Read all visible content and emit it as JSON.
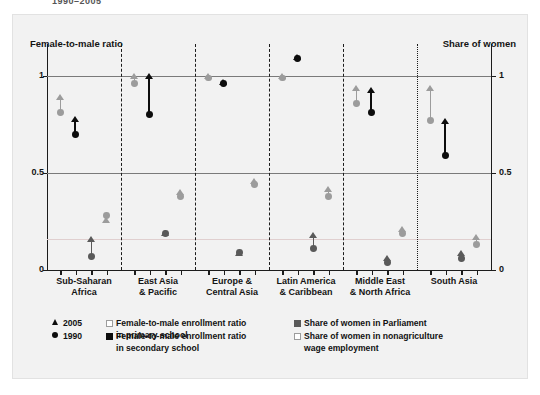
{
  "header": {
    "clipped_top_text": "1990–2005"
  },
  "axis": {
    "left_title": "Female-to-male ratio",
    "right_title": "Share of women",
    "ticks": [
      "1",
      "0.5",
      "0"
    ],
    "tick_values": [
      1,
      0.5,
      0
    ],
    "ymin": 0,
    "ymax": 1.18
  },
  "legend": {
    "year_markers": [
      {
        "symbol": "triangle",
        "label": "2005"
      },
      {
        "symbol": "circle",
        "label": "1990"
      }
    ],
    "series": [
      {
        "label": "Female-to-male enrollment ratio\nin primary school",
        "color": "#9c9c9c",
        "swatch": "open-square"
      },
      {
        "label": "Female-to-male enrollment ratio\nin secondary school",
        "color": "#0d0d0d",
        "swatch": "filled-square"
      },
      {
        "label": "Share of women in Parliament",
        "color": "#5a5a5a",
        "swatch": "filled-square"
      },
      {
        "label": "Share of women in nonagriculture\nwage employment",
        "color": "#9c9c9c",
        "swatch": "open-square"
      }
    ]
  },
  "chart_data": {
    "type": "scatter",
    "title": "",
    "subtitle": "",
    "xlabel": "",
    "ylabel_left": "Female-to-male ratio",
    "ylabel_right": "Share of women",
    "ylim": [
      0,
      1.18
    ],
    "grid": true,
    "gridlines": [
      1,
      0.5
    ],
    "legend_position": "bottom",
    "categories": [
      "Sub-Saharan Africa",
      "East Asia & Pacific",
      "Europe & Central Asia",
      "Latin America & Caribbean",
      "Middle East & North Africa",
      "South Asia"
    ],
    "category_labels_two_line": [
      [
        "Sub-Saharan",
        "Africa"
      ],
      [
        "East Asia",
        "& Pacific"
      ],
      [
        "Europe &",
        "Central Asia"
      ],
      [
        "Latin America",
        "& Caribbean"
      ],
      [
        "Middle East",
        "& North Africa"
      ],
      [
        "South Asia"
      ]
    ],
    "series": [
      {
        "name": "Female-to-male enrollment ratio in primary school",
        "color": "#9c9c9c",
        "values_1990": [
          0.81,
          0.96,
          0.99,
          0.99,
          0.86,
          0.77
        ],
        "values_2005": [
          0.89,
          1.0,
          1.0,
          1.0,
          0.94,
          0.94
        ]
      },
      {
        "name": "Female-to-male enrollment ratio in secondary school",
        "color": "#0d0d0d",
        "values_1990": [
          0.7,
          0.8,
          0.96,
          1.09,
          0.81,
          0.59
        ],
        "values_2005": [
          0.78,
          1.0,
          0.97,
          1.1,
          0.93,
          0.77
        ]
      },
      {
        "name": "Share of women in Parliament",
        "color": "#5a5a5a",
        "values_1990": [
          0.07,
          0.19,
          0.09,
          0.11,
          0.04,
          0.06
        ],
        "values_2005": [
          0.16,
          0.19,
          0.09,
          0.18,
          0.06,
          0.09
        ]
      },
      {
        "name": "Share of women in nonagriculture wage employment",
        "color": "#9c9c9c",
        "values_1990": [
          0.28,
          0.38,
          0.44,
          0.38,
          0.19,
          0.13
        ],
        "values_2005": [
          0.26,
          0.4,
          0.46,
          0.42,
          0.21,
          0.17
        ]
      }
    ]
  }
}
